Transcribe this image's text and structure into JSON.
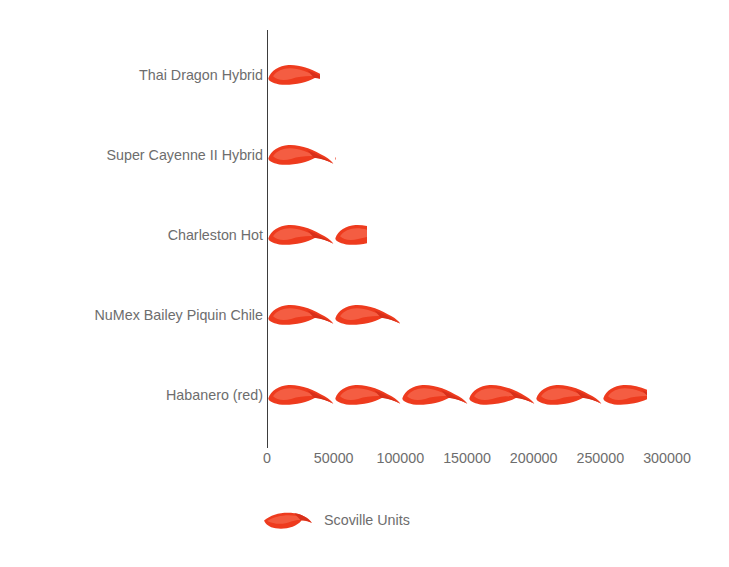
{
  "chart_data": {
    "type": "bar",
    "orientation": "horizontal",
    "title": "",
    "subtitle": "",
    "xlabel": "",
    "ylabel": "",
    "categories": [
      "Thai Dragon Hybrid",
      "Super Cayenne II Hybrid",
      "Charleston Hot",
      "NuMex Bailey Piquin Chile",
      "Habanero (red)"
    ],
    "values": [
      40000,
      52000,
      75000,
      100000,
      285000
    ],
    "series": [
      {
        "name": "Scoville Units",
        "values": [
          40000,
          52000,
          75000,
          100000,
          285000
        ]
      }
    ],
    "xlim": [
      0,
      300000
    ],
    "xticks": [
      0,
      50000,
      100000,
      150000,
      200000,
      250000,
      300000
    ],
    "xtick_labels": [
      "0",
      "50000",
      "100000",
      "150000",
      "200000",
      "250000",
      "300000"
    ],
    "grid": false,
    "legend": {
      "position": "bottom",
      "entries": [
        {
          "label": "Scoville Units",
          "color": "#ee3b1e",
          "icon": "chili-pepper-icon"
        }
      ]
    },
    "pictogram": {
      "glyph": "chili-pepper",
      "unit_value": 50000,
      "units_per_row": [
        0.8,
        1.04,
        1.5,
        2.0,
        5.7
      ]
    },
    "colors": {
      "pepper": "#ee3b1e",
      "pepper_dark": "#d8301a",
      "pepper_highlight": "#f8745a",
      "text": "#6d6d6d",
      "axis": "#3d3d3d",
      "background": "#ffffff"
    }
  },
  "legend_label": "Scoville Units"
}
